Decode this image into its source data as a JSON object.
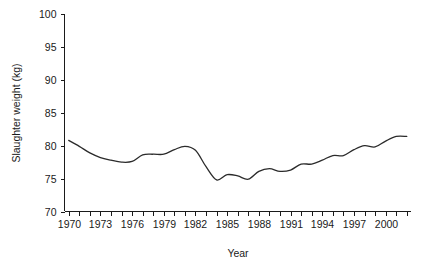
{
  "chart_data": {
    "type": "line",
    "title": "",
    "xlabel": "Year",
    "ylabel": "Slaughter weight (kg)",
    "xlim": [
      1969.6,
      2002.4
    ],
    "ylim": [
      70,
      100
    ],
    "grid": false,
    "legend": "none",
    "y_ticks": [
      70,
      75,
      80,
      85,
      90,
      95,
      100
    ],
    "y_tick_labels": [
      "70",
      "75",
      "80",
      "85",
      "90",
      "95",
      "100"
    ],
    "x_ticks": [
      1970,
      1971,
      1972,
      1973,
      1974,
      1975,
      1976,
      1977,
      1978,
      1979,
      1980,
      1981,
      1982,
      1983,
      1984,
      1985,
      1986,
      1987,
      1988,
      1989,
      1990,
      1991,
      1992,
      1993,
      1994,
      1995,
      1996,
      1997,
      1998,
      1999,
      2000,
      2001,
      2002
    ],
    "x_tick_labels": [
      "1970",
      "",
      "",
      "1973",
      "",
      "",
      "1976",
      "",
      "",
      "1979",
      "",
      "",
      "1982",
      "",
      "",
      "1985",
      "",
      "",
      "1988",
      "",
      "",
      "1991",
      "",
      "",
      "1994",
      "",
      "",
      "1997",
      "",
      "",
      "2000",
      "",
      ""
    ],
    "series": [
      {
        "name": "Slaughter weight",
        "x": [
          1970,
          1971,
          1972,
          1973,
          1974,
          1975,
          1976,
          1977,
          1978,
          1979,
          1980,
          1981,
          1982,
          1983,
          1984,
          1985,
          1986,
          1987,
          1988,
          1989,
          1990,
          1991,
          1992,
          1993,
          1994,
          1995,
          1996,
          1997,
          1998,
          1999,
          2000,
          2001,
          2002
        ],
        "values": [
          80.8,
          79.9,
          78.9,
          78.2,
          77.8,
          77.5,
          77.6,
          78.6,
          78.7,
          78.7,
          79.4,
          79.9,
          79.3,
          76.8,
          74.8,
          75.6,
          75.4,
          74.9,
          76.1,
          76.5,
          76.1,
          76.3,
          77.2,
          77.2,
          77.8,
          78.5,
          78.5,
          79.4,
          80.0,
          79.8,
          80.7,
          81.4,
          81.4
        ]
      }
    ],
    "series_extended_note": ""
  },
  "axis": {
    "y_label": "Slaughter weight (kg)",
    "x_label": "Year"
  }
}
